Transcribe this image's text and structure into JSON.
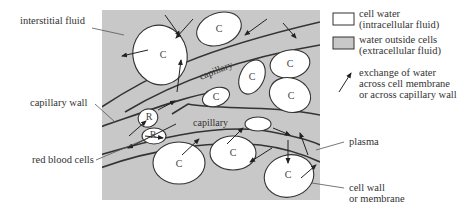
{
  "diagram": {
    "panel_color": "#c8c8c8",
    "cell_color": "#ffffff",
    "labels": {
      "interstitial_fluid": "interstitial fluid",
      "capillary_wall": "capillary wall",
      "red_blood_cells": "red blood cells",
      "plasma": "plasma",
      "cell_wall_line1": "cell wall",
      "cell_wall_line2": "or membrane",
      "capillary_upper": "capillary",
      "capillary_lower": "capillary"
    },
    "cell_letter": "C",
    "rbc_letter": "R"
  },
  "legend": {
    "items": [
      {
        "swatch": "#ffffff",
        "line1": "cell water",
        "line2": "(intracellular fluid)"
      },
      {
        "swatch": "#c8c8c8",
        "line1": "water outside cells",
        "line2": "(extracellular fluid)"
      },
      {
        "symbol": "arrow",
        "line1": "exchange of water",
        "line2": "across cell membrane",
        "line3": "or across capillary wall"
      }
    ]
  }
}
